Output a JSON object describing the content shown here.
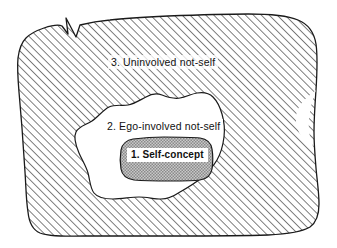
{
  "diagram": {
    "background_color": "#ffffff",
    "outline_color": "#1a1a1a",
    "hatch_color": "#555555",
    "stipple_color": "#9a9a9a",
    "regions": [
      {
        "id": "uninvolved-not-self",
        "number": "3.",
        "label": "3. Uninvolved not-self",
        "fill": "diagonal-hatch",
        "fill_color": "#555555",
        "level": 3
      },
      {
        "id": "ego-involved-not-self",
        "number": "2.",
        "label": "2. Ego-involved not-self",
        "fill": "white",
        "fill_color": "#ffffff",
        "level": 2
      },
      {
        "id": "self-concept",
        "number": "1.",
        "label": "1. Self-concept",
        "fill": "stipple-gray",
        "fill_color": "#a8a8a8",
        "level": 1
      }
    ]
  }
}
